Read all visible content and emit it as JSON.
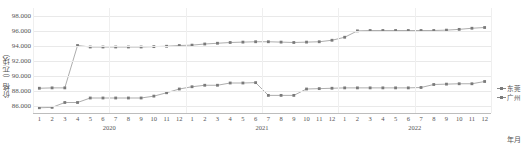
{
  "chart_data": {
    "type": "line",
    "title": "",
    "xlabel": "年月",
    "ylabel": "价格（元/块）",
    "ylim": [
      85,
      99
    ],
    "yticks": [
      "86.000",
      "88.000",
      "90.000",
      "92.000",
      "94.000",
      "96.000",
      "98.000"
    ],
    "ytick_values": [
      86,
      88,
      90,
      92,
      94,
      96,
      98
    ],
    "grid": true,
    "legend_position": "right",
    "years": [
      "2020",
      "2021",
      "2022"
    ],
    "categories": [
      "1",
      "2",
      "3",
      "4",
      "5",
      "6",
      "7",
      "8",
      "9",
      "10",
      "11",
      "12",
      "1",
      "2",
      "3",
      "4",
      "5",
      "6",
      "7",
      "8",
      "9",
      "10",
      "11",
      "12",
      "1",
      "2",
      "3",
      "4",
      "5",
      "6",
      "7",
      "8",
      "9",
      "10",
      "11",
      "12"
    ],
    "series": [
      {
        "name": "东莞",
        "color": "#8a8a8a",
        "values": [
          88.3,
          88.35,
          88.35,
          94.0,
          93.8,
          93.8,
          93.8,
          93.8,
          93.8,
          93.85,
          93.9,
          94.0,
          94.05,
          94.2,
          94.3,
          94.4,
          94.45,
          94.5,
          94.5,
          94.45,
          94.4,
          94.45,
          94.5,
          94.7,
          95.1,
          95.95,
          96.0,
          96.0,
          96.0,
          96.0,
          96.0,
          96.0,
          96.05,
          96.15,
          96.3,
          96.4
        ]
      },
      {
        "name": "广州",
        "color": "#8a8a8a",
        "values": [
          85.7,
          85.75,
          86.4,
          86.4,
          87.0,
          87.0,
          87.0,
          87.0,
          87.0,
          87.25,
          87.7,
          88.2,
          88.5,
          88.7,
          88.7,
          89.0,
          89.0,
          89.05,
          87.35,
          87.35,
          87.35,
          88.2,
          88.25,
          88.3,
          88.35,
          88.35,
          88.35,
          88.35,
          88.35,
          88.35,
          88.4,
          88.8,
          88.85,
          88.9,
          88.9,
          89.2
        ]
      }
    ]
  }
}
